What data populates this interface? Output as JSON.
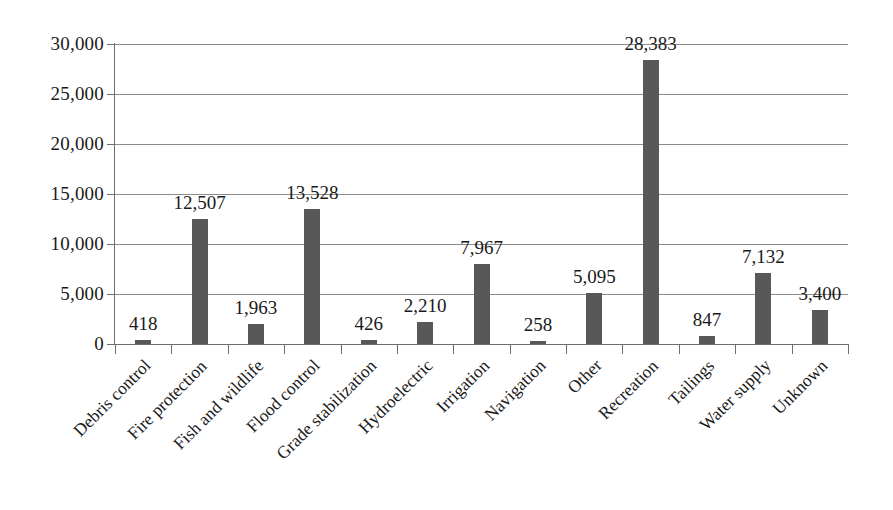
{
  "chart_data": {
    "type": "bar",
    "title": "",
    "subtitle": "",
    "xlabel": "",
    "ylabel": "",
    "ylim": [
      0,
      30000
    ],
    "grid": true,
    "legend": false,
    "orientation": "vertical",
    "bar_color": "#585858",
    "gridline_color": "#8c8c8c",
    "axis_color": "#6e6e6e",
    "background_color": "#ffffff",
    "label_rotation_deg": -45,
    "data_labels_shown": true,
    "categories": [
      "Debris control",
      "Fire protection",
      "Fish and wildlife",
      "Flood control",
      "Grade stabilization",
      "Hydroelectric",
      "Irrigation",
      "Navigation",
      "Other",
      "Recreation",
      "Tailings",
      "Water supply",
      "Unknown"
    ],
    "values": [
      418,
      12507,
      1963,
      13528,
      426,
      2210,
      7967,
      258,
      5095,
      28383,
      847,
      7132,
      3400
    ],
    "value_labels": [
      "418",
      "12,507",
      "1,963",
      "13,528",
      "426",
      "2,210",
      "7,967",
      "258",
      "5,095",
      "28,383",
      "847",
      "7,132",
      "3,400"
    ],
    "yticks": [
      0,
      5000,
      10000,
      15000,
      20000,
      25000,
      30000
    ],
    "ytick_labels": [
      "0",
      "5,000",
      "10,000",
      "15,000",
      "20,000",
      "25,000",
      "30,000"
    ]
  }
}
